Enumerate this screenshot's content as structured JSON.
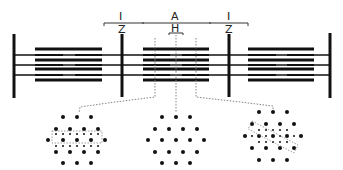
{
  "diagram": {
    "labels": {
      "i_left": "I",
      "z_left": "Z",
      "a_band": "A",
      "h_zone": "H",
      "i_right": "I",
      "z_right": "Z"
    },
    "cross_sections": [
      {
        "id": "overlap-left",
        "description": "Thick and thin filaments (overlap region)"
      },
      {
        "id": "h-zone",
        "description": "Thick filaments only (H zone)"
      },
      {
        "id": "overlap-right",
        "description": "Thick and thin filaments (overlap region)"
      }
    ],
    "colors": {
      "ink": "#111111",
      "dashed": "#777777",
      "background": "#ffffff"
    }
  }
}
